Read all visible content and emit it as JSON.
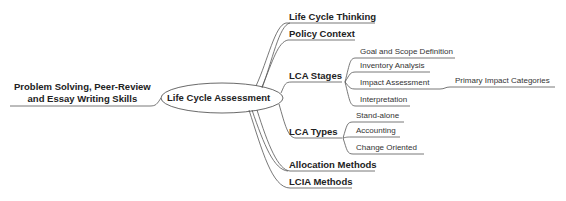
{
  "center": {
    "label": "Life Cycle Assessment"
  },
  "left_branch": {
    "line1": "Problem Solving, Peer-Review",
    "line2": "and Essay Writing Skills"
  },
  "branches": [
    {
      "label": "Life Cycle Thinking"
    },
    {
      "label": "Policy Context"
    },
    {
      "label": "LCA Stages",
      "children": [
        {
          "label": "Goal and Scope Definition"
        },
        {
          "label": "Inventory Analysis"
        },
        {
          "label": "Impact Assessment",
          "children": [
            {
              "label": "Primary Impact Categories"
            }
          ]
        },
        {
          "label": "Interpretation"
        }
      ]
    },
    {
      "label": "LCA Types",
      "children": [
        {
          "label": "Stand-alone"
        },
        {
          "label": "Accounting"
        },
        {
          "label": "Change Oriented"
        }
      ]
    },
    {
      "label": "Allocation Methods"
    },
    {
      "label": "LCIA Methods"
    }
  ],
  "colors": {
    "line": "#555555",
    "text": "#222222",
    "background": "#ffffff"
  }
}
